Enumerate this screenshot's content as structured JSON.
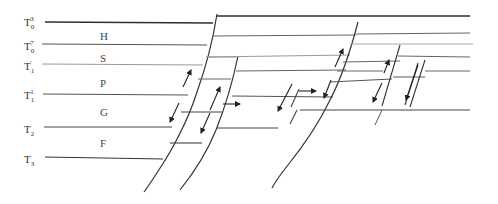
{
  "diagram": {
    "type": "geological-cross-section",
    "horizons": [
      {
        "id": "T0-3",
        "base": "T",
        "sub": "0",
        "sup": "3",
        "y": 22
      },
      {
        "id": "T0-7",
        "base": "T",
        "sub": "0",
        "sup": "7",
        "y": 44
      },
      {
        "id": "T1-prime",
        "base": "T",
        "sub": "1",
        "sup": "′",
        "y": 64
      },
      {
        "id": "T1-1",
        "base": "T",
        "sub": "1",
        "sup": "1",
        "y": 94
      },
      {
        "id": "T2",
        "base": "T",
        "sub": "2",
        "sup": "",
        "y": 127
      },
      {
        "id": "T3",
        "base": "T",
        "sub": "3",
        "sup": "",
        "y": 157
      }
    ],
    "units": [
      {
        "id": "H",
        "label": "H",
        "y": 36
      },
      {
        "id": "S",
        "label": "S",
        "y": 57
      },
      {
        "id": "P",
        "label": "P",
        "y": 83
      },
      {
        "id": "G",
        "label": "G",
        "y": 112
      },
      {
        "id": "F",
        "label": "F",
        "y": 143
      }
    ],
    "colors": {
      "line": "#3a3a3a",
      "light_line": "#8a8a8a",
      "text": "#333333"
    }
  }
}
